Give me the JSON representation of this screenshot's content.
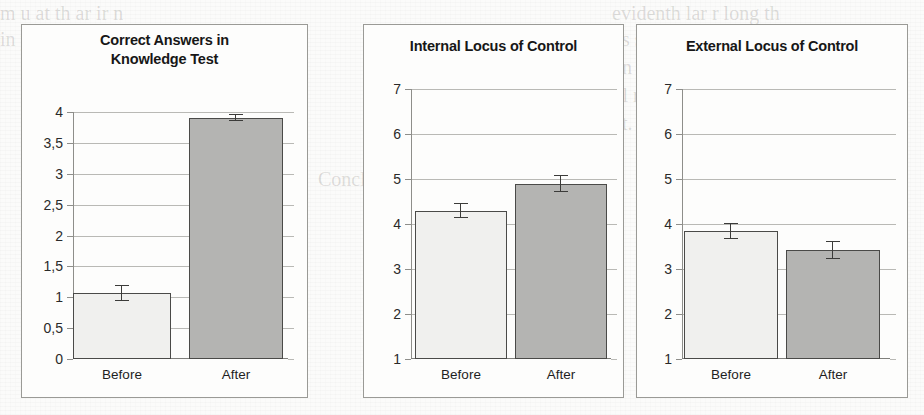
{
  "page": {
    "background_color": "#fbfbfa",
    "ghost_text": [
      "evidenth lar r long th",
      "m  u  at th ar ir n",
      "vs  s mc fort l",
      "in  yn ifi t s a ubj",
      "kn  icter infornm",
      "t  l    r      k  ys",
      "nt. as  to t  ub    rm  lt  nt  l re",
      "Conclusions",
      "Mv                 l",
      "g  09"
    ]
  },
  "charts": [
    {
      "id": "knowledge-test",
      "title_lines": [
        "Correct Answers in",
        "Knowledge Test"
      ],
      "chart_data": {
        "type": "bar",
        "title": "Correct Answers in Knowledge Test",
        "categories": [
          "Before",
          "After"
        ],
        "values": [
          1.07,
          3.91
        ],
        "errors": [
          0.13,
          0.05
        ],
        "xlabel": "",
        "ylabel": "",
        "ylim": [
          0,
          4
        ],
        "ytick_labels": [
          "4",
          "3,5",
          "3",
          "2,5",
          "2",
          "1,5",
          "1",
          "0,5",
          "0"
        ],
        "ytick_values": [
          4,
          3.5,
          3,
          2.5,
          2,
          1.5,
          1,
          0.5,
          0
        ],
        "grid": true,
        "legend": "none",
        "bar_colors": [
          "#f0f0ee",
          "#b4b4b2"
        ]
      }
    },
    {
      "id": "internal-locus",
      "title_lines": [
        "Internal Locus of Control"
      ],
      "chart_data": {
        "type": "bar",
        "title": "Internal Locus of Control",
        "categories": [
          "Before",
          "After"
        ],
        "values": [
          4.3,
          4.9
        ],
        "errors": [
          0.16,
          0.18
        ],
        "xlabel": "",
        "ylabel": "",
        "ylim": [
          1,
          7
        ],
        "ytick_labels": [
          "7",
          "6",
          "5",
          "4",
          "3",
          "2",
          "1"
        ],
        "ytick_values": [
          7,
          6,
          5,
          4,
          3,
          2,
          1
        ],
        "grid": true,
        "legend": "none",
        "bar_colors": [
          "#f0f0ee",
          "#b4b4b2"
        ]
      }
    },
    {
      "id": "external-locus",
      "title_lines": [
        "External Locus of Control"
      ],
      "chart_data": {
        "type": "bar",
        "title": "External Locus of Control",
        "categories": [
          "Before",
          "After"
        ],
        "values": [
          3.85,
          3.42
        ],
        "errors": [
          0.18,
          0.2
        ],
        "xlabel": "",
        "ylabel": "",
        "ylim": [
          1,
          7
        ],
        "ytick_labels": [
          "7",
          "6",
          "5",
          "4",
          "3",
          "2",
          "1"
        ],
        "ytick_values": [
          7,
          6,
          5,
          4,
          3,
          2,
          1
        ],
        "grid": true,
        "legend": "none",
        "bar_colors": [
          "#f0f0ee",
          "#b4b4b2"
        ]
      }
    }
  ]
}
